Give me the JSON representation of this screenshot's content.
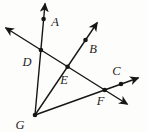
{
  "figure": {
    "background": "#fdfdfc",
    "ink_color": "#161616",
    "label_color": "#1e1e1e",
    "width": 148,
    "height": 132,
    "stroke_width": 1.4,
    "dot_radius": 2.3,
    "font_size": 12.5,
    "points": [
      {
        "label": "A",
        "x": 43.6,
        "y": 19,
        "label_x": 55,
        "label_y": 22
      },
      {
        "label": "B",
        "x": 85.5,
        "y": 40,
        "label_x": 93,
        "label_y": 49
      },
      {
        "label": "C",
        "x": 121,
        "y": 84,
        "label_x": 116.5,
        "label_y": 70.5
      },
      {
        "label": "D",
        "x": 40.9,
        "y": 50,
        "label_x": 27,
        "label_y": 61.5
      },
      {
        "label": "E",
        "x": 67.6,
        "y": 66.7,
        "label_x": 64,
        "label_y": 79.5
      },
      {
        "label": "F",
        "x": 104.7,
        "y": 90,
        "label_x": 100.5,
        "label_y": 100.5
      },
      {
        "label": "G",
        "x": 35,
        "y": 115,
        "label_x": 20,
        "label_y": 125
      }
    ],
    "lines": [
      {
        "name": "line-through-D-E-F",
        "x1": 6,
        "y1": 28,
        "x2": 127,
        "y2": 104,
        "arrow_start": true,
        "arrow_end": true
      },
      {
        "name": "ray-G-through-D-to-A",
        "x1": 35,
        "y1": 115,
        "x2": 45,
        "y2": 4,
        "arrow_start": false,
        "arrow_end": true
      },
      {
        "name": "ray-G-through-E-to-B",
        "x1": 35,
        "y1": 115,
        "x2": 97,
        "y2": 23,
        "arrow_start": false,
        "arrow_end": true
      },
      {
        "name": "ray-G-through-F-to-C",
        "x1": 35,
        "y1": 115,
        "x2": 138,
        "y2": 78,
        "arrow_start": false,
        "arrow_end": true
      }
    ]
  }
}
